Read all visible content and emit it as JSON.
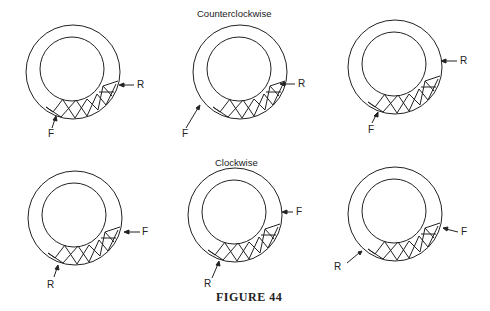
{
  "figure": {
    "caption": "FIGURE 44",
    "sections": [
      {
        "title": "Counterclockwise",
        "diagrams": [
          {
            "labels": {
              "R": "R",
              "F": "F"
            }
          },
          {
            "labels": {
              "R": "R",
              "F": "F"
            }
          },
          {
            "labels": {
              "R": "R",
              "F": "F"
            }
          }
        ]
      },
      {
        "title": "Clockwise",
        "diagrams": [
          {
            "labels": {
              "F": "F",
              "R": "R"
            }
          },
          {
            "labels": {
              "F": "F",
              "R": "R"
            }
          },
          {
            "labels": {
              "F": "F",
              "R": "R"
            }
          }
        ]
      }
    ]
  }
}
